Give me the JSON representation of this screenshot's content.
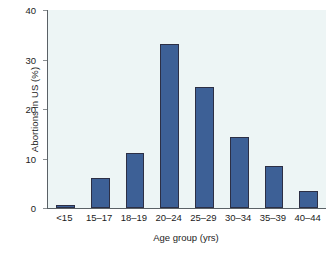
{
  "chart_data": {
    "type": "bar",
    "title": "",
    "xlabel": "Age group (yrs)",
    "ylabel": "Abortions in US (%)",
    "categories": [
      "<15",
      "15–17",
      "18–19",
      "20–24",
      "25–29",
      "30–34",
      "35–39",
      "40–44"
    ],
    "values": [
      0.6,
      6.1,
      11.1,
      33.1,
      24.4,
      14.3,
      8.5,
      3.4
    ],
    "ylim": [
      0,
      40
    ],
    "yticks": [
      0,
      10,
      20,
      30,
      40
    ],
    "ytick_labels": [
      "0",
      "10",
      "20",
      "30",
      "40"
    ],
    "grid": false,
    "legend": null,
    "series": [
      {
        "name": "Abortions in US (%)",
        "values": [
          0.6,
          6.1,
          11.1,
          33.1,
          24.4,
          14.3,
          8.5,
          3.4
        ]
      }
    ],
    "colors": {
      "bar_fill": "#3d6096",
      "bar_edge": "#2c2f45",
      "plot_background": "#edf5f5",
      "axis_line": "#5a6166",
      "figure_background": "#ffffff",
      "text": "#1c1c1c"
    }
  }
}
